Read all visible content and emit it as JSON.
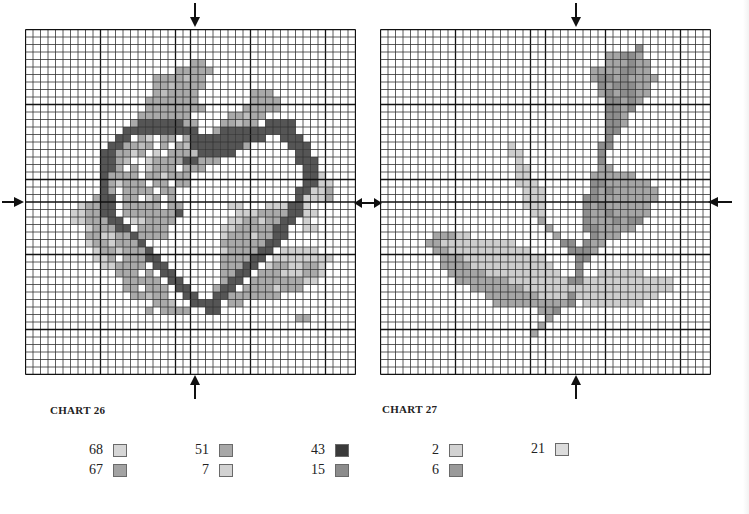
{
  "charts": [
    {
      "title": "CHART 26",
      "cols": 44,
      "rows": 46,
      "cell_size": 7.5,
      "major_every": 10,
      "cells": [
        "............................................",
        "............................................",
        "............................................",
        "............................................",
        "......................bb....................",
        "....................bbbbb...................",
        ".................bbbbcbb....................",
        ".................bbcbbbb....................",
        ".................bcbbbb.......bbb...........",
        "................bbbbbbb.......bbbb..........",
        "................bbbbbbbb.....bbbbb..........",
        "...............bbbbbbb.....bbcbb............",
        "..............bddddddbb...bbcbb.dddd........",
        ".............dddddddddd..bdddddddddd........",
        "............dd.ba.bb.bdddddddddd..ddd.......",
        "...........ddbbcb.b.bcdddddddb.....ddd......",
        "..........ddbbab.a.bbbcddddd........dd......",
        "..........ddbc..abbbbddbbb..........ddd.....",
        "..........ddb.b.abbb.bbb.............dd.....",
        "..........dbbbb.bbabbb...............dda....",
        "..........dbabbb.bb.bb...............ddaa...",
        "..........db.bbbb.bb................ddaab...",
        ".........bdd.bb.ab.b................daaab...",
        ".......abbdd.bbbbb.bb......aa...aaadda......",
        "......aabbdd.bbbbbbbd.......aaabbbbddaa.....",
        "......aabbbdd.aabbbb.......aabbabbdd.a......",
        "........abbbdd.bbbb.......aabbbbbdd..aa.....",
        "........bbaabbdbbbb.......abbbabbdd.........",
        "........abbabbbd..........bbbbbbdd..........",
        ".........abbabbbd.........abbbbdd.aaaaa.....",
        ".........aab.bbbdd........bbbbdd.aaaaaaaa...",
        "..........aabbbb.dd.......bbbdd.abbaabba....",
        "............bbb.b.dd......bbdd.bbbaaabba....",
        ".............bbbbb.dd.....bdd.bbbbbbbaa.....",
        ".............bb.bbb.dd...bdd.bbbbabbb.......",
        "..............bbcbb..dd..ddbbbbbbb..........",
        ".................bbc..dddd.bb...............",
        "................b.bbbb..dd..................",
        "....................................bb......",
        "............................................",
        "............................................",
        "............................................",
        "............................................",
        "............................................",
        "............................................",
        "............................................"
      ]
    },
    {
      "title": "CHART 27",
      "cols": 44,
      "rows": 46,
      "cell_size": 7.5,
      "major_every": 10,
      "cells": [
        "............................................",
        "............................................",
        "..................................f.........",
        "..............................ggffg.........",
        "..............................gggfgg........",
        "............................ggggffgg........",
        "............................gffgfgggg.......",
        ".............................fgfffgg........",
        ".............................gfgffgg........",
        "..............................ffgfg.........",
        "..............................ffgf..........",
        "..............................ffg...........",
        "..............................ffg...........",
        "..............................ff............",
        "..............................f.............",
        ".................e...........ff.............",
        ".................ee..........f..............",
        "..................e..........f..............",
        "..................ee.........gg.............",
        "..................ee........gggggg..........",
        "..................eee.......ffgggggg........",
        "...................eee......fgfgggggg.......",
        "...................eee.....ffgggggggg.......",
        "...................eee.....fgfgggggg........",
        "....................ee.....fggfggggg........",
        ".....................g.....fgggfgff.........",
        "......................g....ffggggg..........",
        ".......gggee...........g....fggg............",
        "......ggeeeeeeeeee......ff.fgg..............",
        ".......ggeeeeeeeeeee.....fffg...............",
        "........gggeeeeeeeeeee....ff................",
        "........ggggeeeeeeeeeee...f.................",
        ".........gggggeeeeeeeeee..f..eeeeee.........",
        "..........gggggggeeeeeeeeffeeeeeeeeeeee.....",
        "............gggggggeeeeeeeeeeeeeeeeeeee.....",
        "..............gggggggeeeefeeeeeeeeeee.......",
        "...............ggggggggggf.eeeeeeee.........",
        ".....................ggf....................",
        "......................g.....................",
        ".....................g......................",
        "....................g.......................",
        "............................................",
        "............................................",
        "............................................",
        "............................................",
        "............................................"
      ]
    }
  ],
  "palette": {
    "a": "#cfcfcf",
    "b": "#a9a9a9",
    "c": "#bdbdbd",
    "d": "#555555",
    "e": "#cdcdcd",
    "f": "#8d8d8d",
    "g": "#a5a5a5"
  },
  "legend": {
    "chart26": [
      {
        "code": "68",
        "color": "#d6d6d6"
      },
      {
        "code": "67",
        "color": "#a3a3a3"
      },
      {
        "code": "51",
        "color": "#a8a8a8"
      },
      {
        "code": "7",
        "color": "#d2d2d2"
      },
      {
        "code": "43",
        "color": "#3a3a3a"
      },
      {
        "code": "15",
        "color": "#8c8c8c"
      }
    ],
    "chart27": [
      {
        "code": "2",
        "color": "#d2d2d2"
      },
      {
        "code": "6",
        "color": "#9a9a9a"
      },
      {
        "code": "21",
        "color": "#dcdcdc"
      }
    ]
  },
  "arrows": {
    "glyph_down": "↓",
    "glyph_up": "↑",
    "glyph_right": "→",
    "glyph_left": "←",
    "glyph_double": "↔"
  }
}
